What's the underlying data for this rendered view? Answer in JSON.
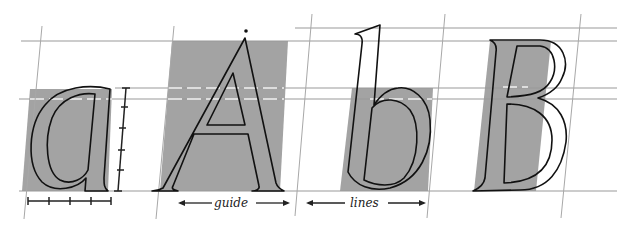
{
  "diagram": {
    "letters": [
      {
        "char": "a",
        "case": "lowercase",
        "shaded_area": "x-height block"
      },
      {
        "char": "A",
        "case": "uppercase",
        "shaded_area": "cap-height block"
      },
      {
        "char": "b",
        "case": "lowercase",
        "shaded_area": "x-height block"
      },
      {
        "char": "B",
        "case": "uppercase",
        "shaded_area": "stem block"
      }
    ],
    "labels": {
      "left": "guide",
      "right": "lines"
    },
    "guide_lines": {
      "ascender_y": 28,
      "cap_height_y": 41,
      "x_height_y": 88,
      "mid_dashed_y": 99,
      "baseline_y": 191
    },
    "measure_ticks": {
      "horizontal_count": 5,
      "vertical_count": 6
    },
    "colors": {
      "shade": "#a3a3a3",
      "guide": "#9a9a9a",
      "outline": "#111111",
      "background": "#ffffff"
    }
  }
}
